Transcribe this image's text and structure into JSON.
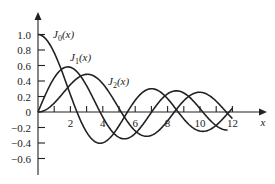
{
  "chart_data": {
    "type": "line",
    "title": "",
    "xlabel": "x",
    "ylabel": "",
    "xlim": [
      0,
      12.5
    ],
    "ylim": [
      -0.7,
      1.1
    ],
    "grid": false,
    "x_ticks": [
      1,
      2,
      3,
      4,
      5,
      6,
      7,
      8,
      9,
      10,
      11,
      12
    ],
    "x_tick_labels": [
      "2",
      "4",
      "6",
      "8",
      "10",
      "12"
    ],
    "x_tick_label_values": [
      2,
      4,
      6,
      8,
      10,
      12
    ],
    "y_ticks": [
      1.0,
      0.8,
      0.6,
      0.4,
      0.2,
      0,
      -0.2,
      -0.4,
      -0.6
    ],
    "y_tick_labels": [
      "1.0",
      "0.8",
      "0.6",
      "0.4",
      "0.2",
      "0",
      "−0.2",
      "−0.4",
      "−0.6"
    ],
    "series": [
      {
        "name": "J0(x)",
        "label_main": "J",
        "label_sub": "0",
        "label_arg": "(x)",
        "order": 0,
        "label_pos": [
          53,
          38
        ],
        "x": [
          0,
          1,
          2,
          2.405,
          3,
          3.832,
          4,
          5,
          5.52,
          6,
          7,
          7.016,
          8,
          8.654,
          9,
          10,
          10.17,
          11,
          11.79,
          12
        ],
        "values": [
          1.0,
          0.765,
          0.224,
          0,
          -0.26,
          -0.403,
          -0.397,
          -0.178,
          0,
          0.151,
          0.3,
          0.3,
          0.172,
          0,
          -0.09,
          -0.246,
          -0.25,
          -0.171,
          0,
          0.048
        ]
      },
      {
        "name": "J1(x)",
        "label_main": "J",
        "label_sub": "1",
        "label_arg": "(x)",
        "order": 1,
        "label_pos": [
          70,
          61
        ],
        "x": [
          0,
          1,
          1.841,
          2,
          3,
          3.832,
          4,
          5,
          5.331,
          6,
          7,
          7.016,
          8,
          8.536,
          9,
          10,
          10.17,
          11,
          11.71
        ],
        "values": [
          0,
          0.44,
          0.582,
          0.577,
          0.339,
          0,
          -0.066,
          -0.328,
          -0.346,
          -0.277,
          -0.005,
          0,
          0.235,
          0.273,
          0.245,
          0.043,
          0,
          -0.177,
          -0.2
        ]
      },
      {
        "name": "J2(x)",
        "label_main": "J",
        "label_sub": "2",
        "label_arg": "(x)",
        "order": 2,
        "label_pos": [
          108,
          85
        ],
        "x": [
          0,
          1,
          2,
          3,
          3.054,
          4,
          5,
          5.136,
          6,
          6.706,
          7,
          8,
          8.417,
          9,
          9.969,
          10,
          11,
          11.62,
          12
        ],
        "values": [
          0,
          0.115,
          0.353,
          0.486,
          0.486,
          0.364,
          0.047,
          0,
          -0.243,
          -0.301,
          -0.301,
          -0.113,
          0,
          0.145,
          0.271,
          0.255,
          0.139,
          0,
          -0.17
        ]
      }
    ]
  }
}
